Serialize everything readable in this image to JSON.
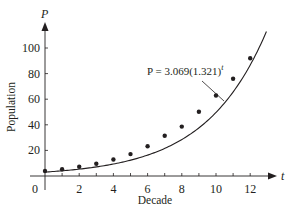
{
  "chart_data": {
    "type": "scatter",
    "title": "",
    "xlabel": "Decade",
    "ylabel": "Population",
    "x_axis_var": "t",
    "y_axis_var": "P",
    "xlim": [
      0,
      13.3
    ],
    "ylim": [
      0,
      110
    ],
    "x_ticks": [
      0,
      1,
      2,
      3,
      4,
      5,
      6,
      7,
      8,
      9,
      10,
      11,
      12
    ],
    "x_tick_labels": [
      "0",
      "2",
      "4",
      "6",
      "8",
      "10",
      "12"
    ],
    "y_ticks": [
      20,
      40,
      60,
      80,
      100
    ],
    "y_tick_labels": [
      "20",
      "40",
      "60",
      "80",
      "100"
    ],
    "grid": false,
    "legend": null,
    "series": [
      {
        "name": "Observed population",
        "kind": "scatter",
        "x": [
          0,
          1,
          2,
          3,
          4,
          5,
          6,
          7,
          8,
          9,
          10,
          11,
          12
        ],
        "y": [
          3.9,
          5.3,
          7.2,
          9.6,
          12.9,
          17.1,
          23.2,
          31.4,
          38.6,
          50.2,
          62.9,
          76.0,
          92.0
        ]
      },
      {
        "name": "Exponential model",
        "kind": "line",
        "model": {
          "a": 3.069,
          "b": 1.321
        },
        "x_range": [
          0,
          12.95
        ]
      }
    ],
    "annotations": [
      {
        "text_prefix": "P = 3.069(1.321)",
        "superscript": "t",
        "points_to": "model curve"
      }
    ]
  },
  "labels": {
    "p_axis": "P",
    "t_axis": "t",
    "origin": "0",
    "xlabel": "Decade",
    "ylabel": "Population",
    "equation_main": "P = 3.069(1.321)",
    "equation_sup": "t"
  }
}
